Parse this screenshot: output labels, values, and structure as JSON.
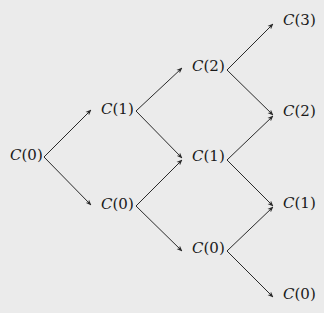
{
  "diagram": {
    "type": "binomial-tree",
    "levels": 4,
    "colors": {
      "background": "#ebebeb",
      "line": "#2a2a2a",
      "text": "#1a1a1a"
    },
    "nodes": [
      {
        "id": "n0_0",
        "level": 0,
        "label_fn": "C",
        "label_arg": "0",
        "x": 10,
        "y": 157
      },
      {
        "id": "n1_1",
        "level": 1,
        "label_fn": "C",
        "label_arg": "1",
        "x": 101,
        "y": 111
      },
      {
        "id": "n1_0",
        "level": 1,
        "label_fn": "C",
        "label_arg": "0",
        "x": 101,
        "y": 206
      },
      {
        "id": "n2_2",
        "level": 2,
        "label_fn": "C",
        "label_arg": "2",
        "x": 192,
        "y": 68
      },
      {
        "id": "n2_1",
        "level": 2,
        "label_fn": "C",
        "label_arg": "1",
        "x": 192,
        "y": 158
      },
      {
        "id": "n2_0",
        "level": 2,
        "label_fn": "C",
        "label_arg": "0",
        "x": 192,
        "y": 250
      },
      {
        "id": "n3_3",
        "level": 3,
        "label_fn": "C",
        "label_arg": "3",
        "x": 283,
        "y": 22
      },
      {
        "id": "n3_2",
        "level": 3,
        "label_fn": "C",
        "label_arg": "2",
        "x": 283,
        "y": 113
      },
      {
        "id": "n3_1",
        "level": 3,
        "label_fn": "C",
        "label_arg": "1",
        "x": 283,
        "y": 205
      },
      {
        "id": "n3_0",
        "level": 3,
        "label_fn": "C",
        "label_arg": "0",
        "x": 283,
        "y": 296
      }
    ],
    "edges": [
      {
        "from": "n0_0",
        "to": "n1_1",
        "x1": 44,
        "y1": 157,
        "x2": 91,
        "y2": 110
      },
      {
        "from": "n0_0",
        "to": "n1_0",
        "x1": 44,
        "y1": 157,
        "x2": 91,
        "y2": 205
      },
      {
        "from": "n1_1",
        "to": "n2_2",
        "x1": 136,
        "y1": 111,
        "x2": 182,
        "y2": 68
      },
      {
        "from": "n1_1",
        "to": "n2_1",
        "x1": 136,
        "y1": 111,
        "x2": 182,
        "y2": 158
      },
      {
        "from": "n1_0",
        "to": "n2_1",
        "x1": 136,
        "y1": 206,
        "x2": 182,
        "y2": 160
      },
      {
        "from": "n1_0",
        "to": "n2_0",
        "x1": 136,
        "y1": 206,
        "x2": 182,
        "y2": 251
      },
      {
        "from": "n2_2",
        "to": "n3_3",
        "x1": 227,
        "y1": 70,
        "x2": 273,
        "y2": 24
      },
      {
        "from": "n2_2",
        "to": "n3_2",
        "x1": 227,
        "y1": 70,
        "x2": 273,
        "y2": 115
      },
      {
        "from": "n2_1",
        "to": "n3_2",
        "x1": 227,
        "y1": 160,
        "x2": 273,
        "y2": 116
      },
      {
        "from": "n2_1",
        "to": "n3_1",
        "x1": 227,
        "y1": 160,
        "x2": 273,
        "y2": 206
      },
      {
        "from": "n2_0",
        "to": "n3_1",
        "x1": 227,
        "y1": 251,
        "x2": 273,
        "y2": 207
      },
      {
        "from": "n2_0",
        "to": "n3_0",
        "x1": 227,
        "y1": 251,
        "x2": 273,
        "y2": 297
      }
    ]
  }
}
